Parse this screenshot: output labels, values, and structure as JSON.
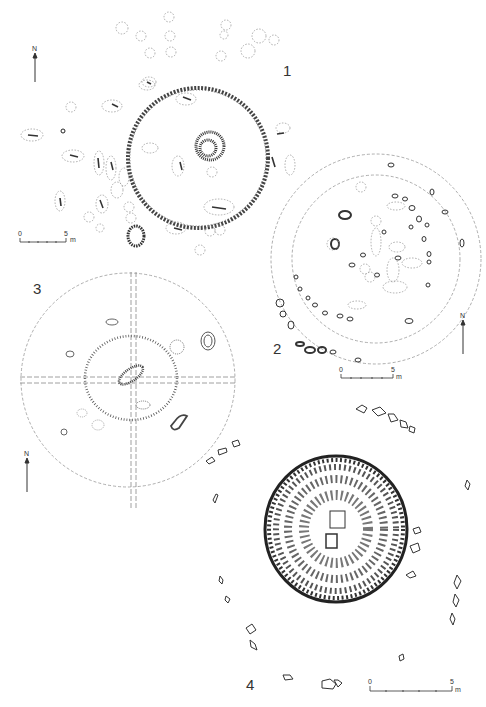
{
  "figure": {
    "plans": [
      {
        "number": "1",
        "north_label": "N",
        "scale": {
          "start": "0",
          "end": "5",
          "unit": "m"
        }
      },
      {
        "number": "2",
        "north_label": "N",
        "scale": {
          "start": "0",
          "end": "5",
          "unit": "m"
        }
      },
      {
        "number": "3",
        "north_label": "N"
      },
      {
        "number": "4",
        "scale": {
          "start": "0",
          "end": "5",
          "unit": "m"
        }
      }
    ]
  }
}
